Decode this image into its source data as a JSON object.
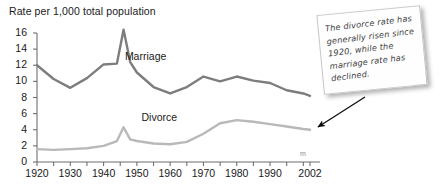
{
  "chart_data": {
    "type": "line",
    "title": "Rate per 1,000 total population",
    "xlabel": "",
    "ylabel": "Rate per 1,000 total population",
    "xlim": [
      1920,
      2002
    ],
    "ylim": [
      0,
      16
    ],
    "yticks": [
      0,
      2,
      4,
      6,
      8,
      10,
      12,
      14,
      16
    ],
    "xticks": [
      1920,
      1925,
      1930,
      1935,
      1940,
      1945,
      1950,
      1955,
      1960,
      1965,
      1970,
      1975,
      1980,
      1985,
      1990,
      1995,
      2000,
      2002
    ],
    "xtick_labels": [
      "1920",
      "1930",
      "1940",
      "1950",
      "1960",
      "1970",
      "1980",
      "1990",
      "2002"
    ],
    "xtick_label_values": [
      1920,
      1930,
      1940,
      1950,
      1960,
      1970,
      1980,
      1990,
      2002
    ],
    "grid": false,
    "legend": "inline-labels",
    "x": [
      1920,
      1925,
      1930,
      1935,
      1940,
      1944,
      1946,
      1948,
      1950,
      1955,
      1960,
      1965,
      1970,
      1975,
      1980,
      1985,
      1990,
      1995,
      2000,
      2002
    ],
    "series": [
      {
        "name": "Marriage",
        "color": "#7d7d7d",
        "label_x": 1950,
        "label_y": 13.0,
        "values": [
          12.0,
          10.3,
          9.2,
          10.4,
          12.1,
          12.2,
          16.4,
          12.4,
          11.1,
          9.3,
          8.5,
          9.3,
          10.6,
          10.0,
          10.6,
          10.1,
          9.8,
          8.9,
          8.5,
          8.2
        ]
      },
      {
        "name": "Divorce",
        "color": "#b9b9b9",
        "label_x": 1955,
        "label_y": 5.4,
        "values": [
          1.6,
          1.5,
          1.6,
          1.7,
          2.0,
          2.6,
          4.3,
          2.8,
          2.6,
          2.3,
          2.2,
          2.5,
          3.5,
          4.8,
          5.2,
          5.0,
          4.7,
          4.4,
          4.1,
          4.0
        ]
      }
    ],
    "annotation": {
      "text": "The divorce rate has generally risen since 1920, while the marriage rate has declined.",
      "style": "sticky-note",
      "arrow": "points-to-divorce-line-end"
    },
    "axis_end_glyph": "m"
  },
  "axis": {
    "y_tick_labels": [
      "16",
      "14",
      "12",
      "10",
      "8",
      "6",
      "4",
      "2",
      "0"
    ],
    "x_tick_labels": [
      "1920",
      "1930",
      "1940",
      "1950",
      "1960",
      "1970",
      "1980",
      "1990",
      "2002"
    ]
  },
  "labels": {
    "marriage": "Marriage",
    "divorce": "Divorce"
  },
  "note": {
    "text": "The divorce rate has generally risen since 1920, while the marriage rate has declined."
  }
}
